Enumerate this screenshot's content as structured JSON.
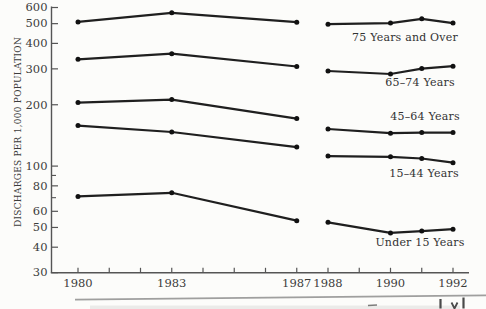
{
  "page": {
    "background": "#fcfcfa"
  },
  "chart_data": {
    "type": "line",
    "title": "",
    "xlabel": "",
    "ylabel": "DISCHARGES PER 1,000 POPULATION",
    "y_scale": "log",
    "ylim": [
      30,
      600
    ],
    "xlim": [
      1980,
      1992
    ],
    "grid": false,
    "legend_position": "inline-right-of-plot-labels",
    "line_color": "#1f1f1f",
    "marker_color": "#111111",
    "text_color": "#3c3c3c",
    "axis_color": "#555555",
    "y_ticks_labeled": [
      600,
      500,
      400,
      300,
      200,
      100,
      80,
      60,
      50,
      40,
      30
    ],
    "y_ticks_minor": [
      90,
      70
    ],
    "x_ticks_labeled": [
      1980,
      1983,
      1987,
      1988,
      1990,
      1992
    ],
    "x_ticks_minor": [
      1981,
      1982,
      1984,
      1985,
      1986,
      1989,
      1991
    ],
    "break_between_years": [
      1987,
      1988
    ],
    "series": [
      {
        "name": "75 Years and Over",
        "label_pos": {
          "x": 405,
          "y": 37
        },
        "segments": [
          {
            "x": [
              1980,
              1983,
              1987
            ],
            "y": [
              510,
              565,
              508
            ]
          },
          {
            "x": [
              1988,
              1990,
              1991,
              1992
            ],
            "y": [
              497,
              503,
              528,
              503
            ]
          }
        ]
      },
      {
        "name": "65–74 Years",
        "label_pos": {
          "x": 420,
          "y": 82
        },
        "segments": [
          {
            "x": [
              1980,
              1983,
              1987
            ],
            "y": [
              334,
              356,
              308
            ]
          },
          {
            "x": [
              1988,
              1990,
              1991,
              1992
            ],
            "y": [
              293,
              283,
              301,
              309
            ]
          }
        ]
      },
      {
        "name": "45–64 Years",
        "label_pos": {
          "x": 425,
          "y": 116
        },
        "segments": [
          {
            "x": [
              1980,
              1983,
              1987
            ],
            "y": [
              205,
              212,
              171
            ]
          },
          {
            "x": [
              1988,
              1990,
              1991,
              1992
            ],
            "y": [
              152,
              145,
              146,
              146
            ]
          }
        ]
      },
      {
        "name": "15–44 Years",
        "label_pos": {
          "x": 424,
          "y": 173
        },
        "segments": [
          {
            "x": [
              1980,
              1983,
              1987
            ],
            "y": [
              158,
              147,
              124
            ]
          },
          {
            "x": [
              1988,
              1990,
              1991,
              1992
            ],
            "y": [
              112,
              111,
              109,
              104
            ]
          }
        ]
      },
      {
        "name": "Under 15 Years",
        "label_pos": {
          "x": 420,
          "y": 242
        },
        "segments": [
          {
            "x": [
              1980,
              1983,
              1987
            ],
            "y": [
              71,
              74,
              54
            ]
          },
          {
            "x": [
              1988,
              1990,
              1991,
              1992
            ],
            "y": [
              53,
              47,
              48,
              49
            ]
          }
        ]
      }
    ]
  },
  "footer": {
    "rule_color": "#8f8f8f",
    "fragment_color": "#4a4a4a"
  }
}
